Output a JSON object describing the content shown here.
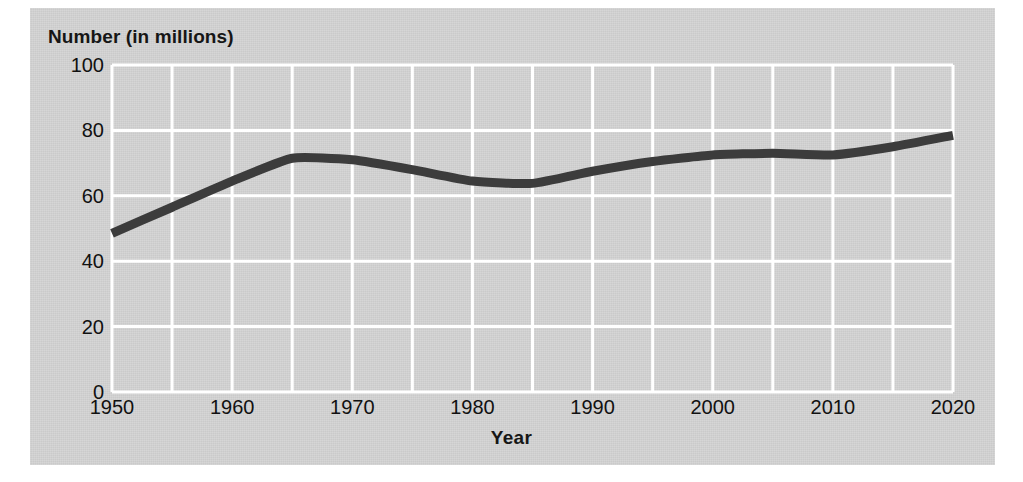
{
  "figure": {
    "background_color": "#d2d2d2",
    "page_color": "#ffffff",
    "gridline_color": "#ffffff",
    "line_color": "#3c3c3c",
    "text_color": "#111111"
  },
  "chart_data": {
    "type": "line",
    "title": "",
    "xlabel": "Year",
    "ylabel": "Number (in millions)",
    "xlim": [
      1950,
      2020
    ],
    "ylim": [
      0,
      100
    ],
    "grid": true,
    "grid_x_step": 5,
    "grid_y_step": 20,
    "legend": "none",
    "x_tick_labels": [
      "1950",
      "1960",
      "1970",
      "1980",
      "1990",
      "2000",
      "2010",
      "2020"
    ],
    "x_ticks": [
      1950,
      1960,
      1970,
      1980,
      1990,
      2000,
      2010,
      2020
    ],
    "y_tick_labels": [
      "0",
      "20",
      "40",
      "60",
      "80",
      "100"
    ],
    "y_ticks": [
      0,
      20,
      40,
      60,
      80,
      100
    ],
    "series": [
      {
        "name": "Number (in millions)",
        "x": [
          1950,
          1955,
          1960,
          1965,
          1970,
          1975,
          1980,
          1985,
          1990,
          1995,
          2000,
          2005,
          2010,
          2015,
          2020
        ],
        "values": [
          48.5,
          56.5,
          64.5,
          71.5,
          71.0,
          68.0,
          64.5,
          63.8,
          67.5,
          70.5,
          72.5,
          73.0,
          72.5,
          75.0,
          78.5
        ]
      }
    ]
  }
}
